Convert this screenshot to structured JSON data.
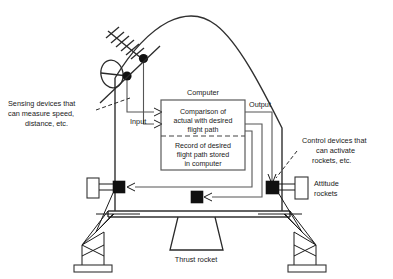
{
  "diagram": {
    "computer": {
      "header_label": "Computer",
      "upper_block_lines": [
        "Comparison of",
        "actual with desired",
        "flight path"
      ],
      "lower_block_lines": [
        "Record of desired",
        "flight path stored",
        "in computer"
      ]
    },
    "flow_labels": {
      "input": "Input",
      "output": "Output"
    },
    "annotations": {
      "sensing": [
        "Sensing devices that",
        "can measure speed,",
        "distance, etc."
      ],
      "control": [
        "Control devices that",
        "can activate",
        "rockets, etc."
      ],
      "attitude": [
        "Attitude",
        "rockets"
      ],
      "thrust": "Thrust rocket"
    },
    "colors": {
      "ink": "#1a1a1a",
      "line": "#333333",
      "node": "#111111",
      "background": "#ffffff"
    }
  }
}
